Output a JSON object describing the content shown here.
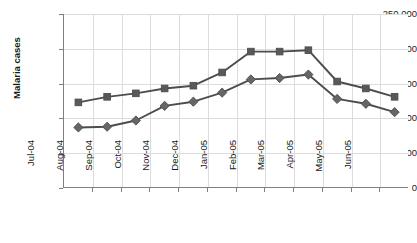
{
  "chart_data": {
    "type": "line",
    "title": "",
    "xlabel": "",
    "ylabel": "Malaria cases",
    "ylim": [
      0,
      250000
    ],
    "ytick_labels": [
      "250,000",
      "200,000",
      "150,000",
      "100,000",
      "50,000",
      "0"
    ],
    "ytick_values": [
      250000,
      200000,
      150000,
      100000,
      50000,
      0
    ],
    "grid": true,
    "legend": "none",
    "categories": [
      "Jul-04",
      "Aug-04",
      "Sep-04",
      "Oct-04",
      "Nov-04",
      "Dec-04",
      "Jan-05",
      "Feb-05",
      "Mar-05",
      "Apr-05",
      "May-05",
      "Jun-05"
    ],
    "series": [
      {
        "name": "upper-series",
        "marker": "square",
        "color": "#595959",
        "values": [
          123000,
          131000,
          136000,
          143000,
          147000,
          166000,
          196000,
          196000,
          198000,
          153000,
          143000,
          131000
        ]
      },
      {
        "name": "lower-series",
        "marker": "diamond",
        "color": "#666666",
        "values": [
          87000,
          88000,
          97000,
          118000,
          124000,
          137000,
          156000,
          158000,
          163000,
          128000,
          121000,
          109000
        ]
      }
    ]
  },
  "axis": {
    "y_title": "Malaria cases"
  },
  "colors": {
    "line": "#4d4d4d",
    "marker": "#5e5e5e",
    "grid": "#dcdcdc",
    "axis": "#808080",
    "text": "#1a1a1a",
    "background": "#ffffff"
  }
}
